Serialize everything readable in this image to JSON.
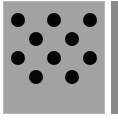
{
  "stimulus": {
    "panel_color": "#a2a2a2",
    "side_panel_color": "#8a8a8a",
    "dot_color": "#050505",
    "dot_count": 10,
    "dots": [
      {
        "x": 18,
        "y": 20
      },
      {
        "x": 54,
        "y": 20
      },
      {
        "x": 90,
        "y": 20
      },
      {
        "x": 36,
        "y": 39
      },
      {
        "x": 72,
        "y": 39
      },
      {
        "x": 18,
        "y": 58
      },
      {
        "x": 54,
        "y": 58
      },
      {
        "x": 90,
        "y": 58
      },
      {
        "x": 36,
        "y": 77
      },
      {
        "x": 72,
        "y": 77
      }
    ]
  }
}
